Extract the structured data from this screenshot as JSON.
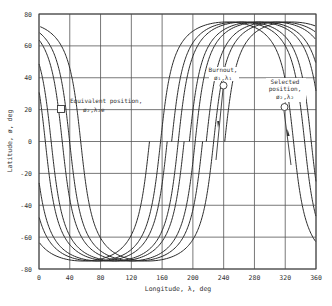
{
  "chart_data": {
    "type": "line",
    "title": "",
    "xlabel": "Longitude, λ, deg",
    "ylabel": "Latitude, ø, deg",
    "xlim": [
      0,
      360
    ],
    "ylim": [
      -80,
      80
    ],
    "xticks": [
      0,
      40,
      80,
      120,
      160,
      200,
      240,
      280,
      320,
      360
    ],
    "yticks": [
      -80,
      -60,
      -40,
      -20,
      0,
      20,
      40,
      60,
      80
    ],
    "xtick_labels": [
      "0",
      "40",
      "80",
      "120",
      "160",
      "200",
      "240",
      "280",
      "320",
      "360"
    ],
    "ytick_labels": [
      "-80",
      "-60",
      "-40",
      "-20",
      "0",
      "20",
      "40",
      "60",
      "80"
    ],
    "grid": true,
    "legend": null,
    "track_model": {
      "description": "Ground tracks of four circular orbits, inclination ~75 deg, ascending nodes spaced ~23 deg apart",
      "inclination_deg": 75,
      "earth_rotation_factor": 0.04
    },
    "series": [
      {
        "name": "Track 1",
        "ascending_node_deg": 158,
        "max_lat": 75,
        "min_lat": -75,
        "points": [
          [
            0,
            -25
          ],
          [
            40,
            -62
          ],
          [
            70,
            -74
          ],
          [
            100,
            -62
          ],
          [
            130,
            -30
          ],
          [
            158,
            0
          ],
          [
            190,
            40
          ],
          [
            220,
            65
          ],
          [
            250,
            74
          ],
          [
            280,
            70
          ],
          [
            310,
            40
          ],
          [
            331,
            0
          ],
          [
            360,
            -30
          ]
        ]
      },
      {
        "name": "Track 2",
        "ascending_node_deg": 181,
        "max_lat": 75,
        "min_lat": -75,
        "points": [
          [
            0,
            -53
          ],
          [
            40,
            -72
          ],
          [
            85,
            -74
          ],
          [
            120,
            -55
          ],
          [
            150,
            -30
          ],
          [
            181,
            0
          ],
          [
            210,
            40
          ],
          [
            240,
            66
          ],
          [
            270,
            74
          ],
          [
            300,
            66
          ],
          [
            330,
            35
          ],
          [
            357,
            0
          ]
        ]
      },
      {
        "name": "Track 3",
        "ascending_node_deg": 203,
        "max_lat": 75,
        "min_lat": -75,
        "points": [
          [
            0,
            62
          ],
          [
            13,
            0
          ],
          [
            30,
            -40
          ],
          [
            60,
            -68
          ],
          [
            100,
            -74
          ],
          [
            140,
            -55
          ],
          [
            170,
            -30
          ],
          [
            203,
            0
          ],
          [
            230,
            40
          ],
          [
            260,
            68
          ],
          [
            290,
            74
          ],
          [
            320,
            60
          ],
          [
            340,
            35
          ],
          [
            360,
            8
          ]
        ]
      },
      {
        "name": "Track 4",
        "ascending_node_deg": 227,
        "max_lat": 75,
        "min_lat": -75,
        "points": [
          [
            0,
            35
          ],
          [
            39,
            0
          ],
          [
            60,
            -38
          ],
          [
            90,
            -66
          ],
          [
            115,
            -74
          ],
          [
            150,
            -62
          ],
          [
            190,
            -35
          ],
          [
            227,
            0
          ],
          [
            250,
            40
          ],
          [
            280,
            72
          ],
          [
            310,
            72
          ],
          [
            340,
            55
          ],
          [
            360,
            40
          ]
        ]
      }
    ],
    "annotations": [
      {
        "label": "Equivalent position,",
        "sublabel": "ø₂,λ₂e",
        "marker": "square",
        "lambda": 38,
        "phi": 20
      },
      {
        "label": "Burnout,",
        "sublabel": "ø₁,λ₁",
        "marker": "circle",
        "lambda": 239,
        "phi": 35,
        "arrow": "down"
      },
      {
        "label": "Selected position,",
        "sublabel": "ø₂,λ₂",
        "marker": "circle",
        "lambda": 318,
        "phi": 22,
        "arrow": "up"
      }
    ]
  }
}
